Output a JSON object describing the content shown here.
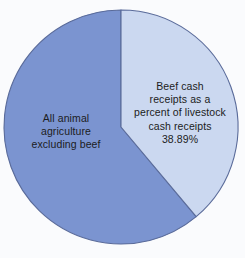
{
  "chart_data": {
    "type": "pie",
    "title": "",
    "subtitle": "",
    "xlabel": "",
    "ylabel": "",
    "grid": false,
    "legend_position": "none",
    "start_angle_deg": 0,
    "direction": "clockwise",
    "categories": [
      "Beef cash receipts as a percent of livestock cash receipts",
      "All animal agriculture excluding beef"
    ],
    "values": [
      38.89,
      61.11
    ],
    "value_unit": "percent",
    "slices": [
      {
        "name": "beef-cash-receipts",
        "label": "Beef cash\nreceipts as a\npercent of livestock\ncash receipts\n38.89%",
        "label_text": "Beef cash receipts as a percent of livestock cash receipts 38.89%",
        "value": 38.89,
        "value_label": "38.89%",
        "color": "#cbd8f0",
        "start_deg": 0,
        "end_deg": 140.0
      },
      {
        "name": "all-animal-agriculture-excluding-beef",
        "label": "All animal\nagriculture\nexcluding beef",
        "label_text": "All animal agriculture excluding beef",
        "value": 61.11,
        "value_label": "",
        "color": "#7b94d0",
        "start_deg": 140.0,
        "end_deg": 360.0
      }
    ]
  },
  "style": {
    "background": "#fafbfd",
    "stroke": "#5a6b9a",
    "text_color": "#1c1c22",
    "slice_beef_color": "#cbd8f0",
    "slice_other_color": "#7b94d0"
  },
  "geometry": {
    "center_x": 121,
    "center_y": 127,
    "radius": 117
  }
}
